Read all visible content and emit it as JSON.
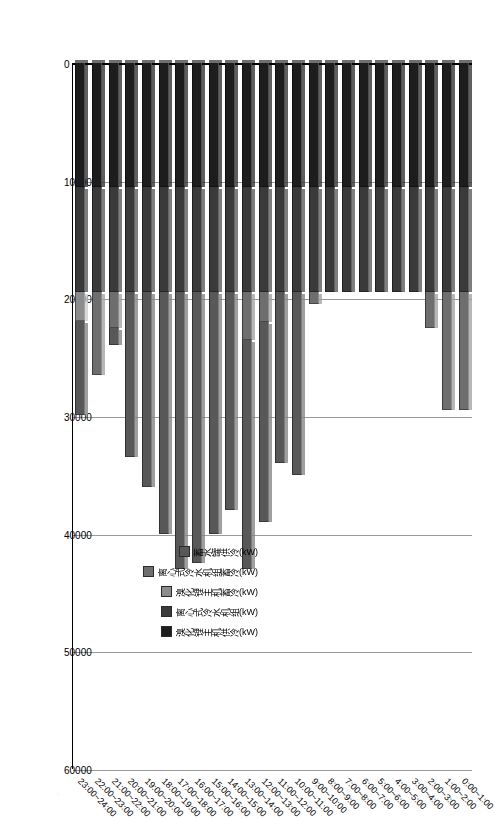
{
  "chart_data": {
    "type": "bar",
    "orientation": "horizontal-stacked",
    "title": "",
    "xlabel": "",
    "ylabel": "",
    "xlim": [
      0,
      60000
    ],
    "xticks": [
      0,
      10000,
      20000,
      30000,
      40000,
      50000,
      60000
    ],
    "grid": true,
    "legend_position": "inside-lower-left",
    "categories": [
      "0:00~1:00",
      "1:00~2:00",
      "2:00~3:00",
      "3:00~4:00",
      "4:00~5:00",
      "5:00~6:00",
      "6:00~7:00",
      "7:00~8:00",
      "8:00~9:00",
      "9:00~10:00",
      "10:00~11:00",
      "11:00~12:00",
      "12:00~13:00",
      "13:00~14:00",
      "14:00~15:00",
      "15:00~16:00",
      "16:00~17:00",
      "17:00~18:00",
      "18:00~19:00",
      "19:00~20:00",
      "20:00~21:00",
      "21:00~22:00",
      "22:00~23:00",
      "23:00~24:00"
    ],
    "series": [
      {
        "name": "溴化锂主机供冷(kW)",
        "color": "#1d1d1d",
        "values": [
          10500,
          10500,
          10500,
          10500,
          10500,
          10500,
          10500,
          10500,
          10500,
          10500,
          10500,
          10500,
          10500,
          10500,
          10500,
          10500,
          10500,
          10500,
          10500,
          10500,
          10500,
          10500,
          10500,
          10500
        ]
      },
      {
        "name": "离心式冷水机组(kW)",
        "color": "#3a3a3a",
        "values": [
          9000,
          9000,
          9000,
          9000,
          9000,
          9000,
          9000,
          9000,
          9000,
          9000,
          9000,
          9000,
          9000,
          9000,
          9000,
          9000,
          9000,
          9000,
          9000,
          9000,
          9000,
          9000,
          9000,
          9000
        ]
      },
      {
        "name": "溴化锂主机蓄冷(kW)",
        "color": "#8c8c8c",
        "values": [
          0,
          0,
          0,
          0,
          0,
          0,
          0,
          0,
          0,
          0,
          0,
          0,
          0,
          0,
          0,
          0,
          0,
          0,
          0,
          0,
          0,
          0,
          0,
          2400
        ]
      },
      {
        "name": "离心式冷水机组蓄冷(kW)",
        "color": "#6e6e6e",
        "values": [
          10000,
          10000,
          3000,
          0,
          0,
          0,
          0,
          0,
          0,
          1000,
          0,
          0,
          2500,
          4000,
          0,
          0,
          0,
          0,
          0,
          0,
          0,
          3000,
          7000,
          0
        ]
      },
      {
        "name": "蓄水罐供冷(kW)",
        "color": "#585858",
        "values": [
          0,
          0,
          0,
          0,
          0,
          0,
          0,
          0,
          0,
          0,
          15500,
          14500,
          17000,
          19500,
          18500,
          20500,
          23000,
          23500,
          20500,
          16500,
          14000,
          1500,
          0,
          8000
        ]
      }
    ],
    "stack_order": [
      "溴化锂主机供冷(kW)",
      "离心式冷水机组(kW)",
      "溴化锂主机蓄冷(kW)",
      "离心式冷水机组蓄冷(kW)",
      "蓄水罐供冷(kW)"
    ],
    "legend_entries": [
      "蓄水罐供冷(kW)",
      "离心式冷水机组蓄冷(kW)",
      "溴化锂主机蓄冷(kW)",
      "离心式冷水机组(kW)",
      "溴化锂主机供冷(kW)"
    ]
  }
}
